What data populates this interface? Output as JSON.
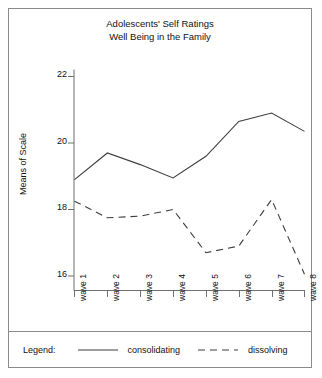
{
  "chart_data": {
    "type": "line",
    "title": "Adolescents' Self Ratings\nWell Being in the Family",
    "title_line1": "Adolescents' Self Ratings",
    "title_line2": "Well Being in the Family",
    "xlabel": "",
    "ylabel": "Means of Scale",
    "categories": [
      "wave 1",
      "wave 2",
      "wave 3",
      "wave 4",
      "wave 5",
      "wave 6",
      "wave 7",
      "wave 8"
    ],
    "ylim": [
      15.3,
      22.2
    ],
    "yticks": [
      16,
      18,
      20,
      22
    ],
    "ytick_labels": [
      "16",
      "18",
      "20",
      "22"
    ],
    "grid": false,
    "legend_position": "bottom",
    "series": [
      {
        "name": "consolidating",
        "style": "solid",
        "color": "#3d3d3d",
        "values": [
          18.9,
          19.7,
          19.35,
          18.95,
          19.6,
          20.65,
          20.9,
          20.35
        ]
      },
      {
        "name": "dissolving",
        "style": "dashed",
        "color": "#3d3d3d",
        "values": [
          18.25,
          17.75,
          17.8,
          18.0,
          16.7,
          16.9,
          18.3,
          16.05
        ]
      }
    ]
  },
  "legend": {
    "title": "Legend:",
    "entries": [
      {
        "label": "consolidating",
        "style": "solid"
      },
      {
        "label": "dissolving",
        "style": "dashed"
      }
    ]
  }
}
